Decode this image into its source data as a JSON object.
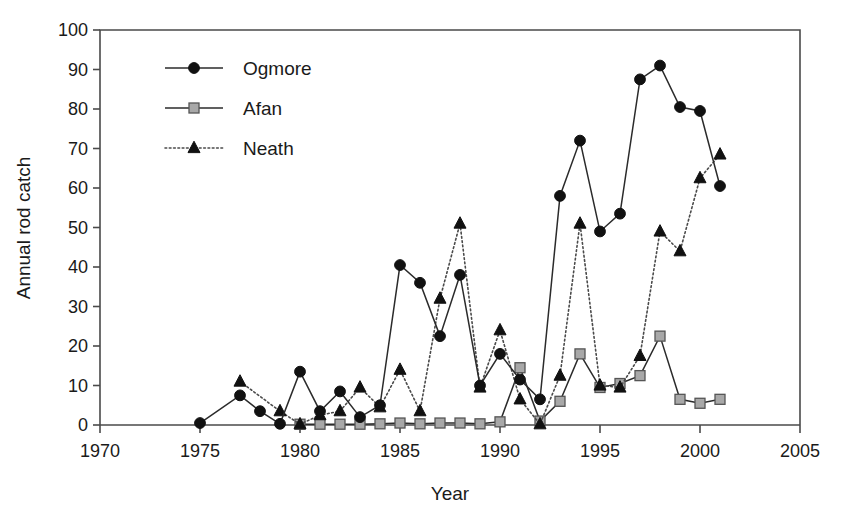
{
  "chart_data": {
    "type": "line",
    "title": "",
    "xlabel": "Year",
    "ylabel": "Annual rod catch",
    "xlim": [
      1970,
      2005
    ],
    "ylim": [
      0,
      100
    ],
    "xticks": [
      1970,
      1975,
      1980,
      1985,
      1990,
      1995,
      2000,
      2005
    ],
    "yticks": [
      0,
      10,
      20,
      30,
      40,
      50,
      60,
      70,
      80,
      90,
      100
    ],
    "grid": false,
    "legend_position": "top-left inside",
    "series": [
      {
        "name": "Ogmore",
        "marker": "filled-circle",
        "line_style": "solid",
        "color": "#111111",
        "x": [
          1975,
          1977,
          1978,
          1979,
          1980,
          1981,
          1982,
          1983,
          1984,
          1985,
          1986,
          1987,
          1988,
          1989,
          1990,
          1991,
          1992,
          1993,
          1994,
          1995,
          1996,
          1997,
          1998,
          1999,
          2000,
          2001
        ],
        "values": [
          0.5,
          7.5,
          3.5,
          0.3,
          13.5,
          3.5,
          8.5,
          2.0,
          5.0,
          40.5,
          36.0,
          22.5,
          38.0,
          10.0,
          18.0,
          11.5,
          6.5,
          58.0,
          72.0,
          49.0,
          53.5,
          87.5,
          91.0,
          80.5,
          79.5,
          60.5
        ]
      },
      {
        "name": "Afan",
        "marker": "gray-square",
        "line_style": "solid",
        "color": "#a8a8a8",
        "x": [
          1980,
          1981,
          1982,
          1983,
          1984,
          1985,
          1986,
          1987,
          1988,
          1989,
          1990,
          1991,
          1992,
          1993,
          1994,
          1995,
          1996,
          1997,
          1998,
          1999,
          2000,
          2001
        ],
        "values": [
          0.2,
          0.2,
          0.2,
          0.2,
          0.3,
          0.5,
          0.3,
          0.5,
          0.5,
          0.3,
          0.8,
          14.5,
          1.0,
          6.0,
          18.0,
          9.5,
          10.5,
          12.5,
          22.5,
          6.5,
          5.5,
          6.5
        ]
      },
      {
        "name": "Neath",
        "marker": "filled-triangle",
        "line_style": "dotted",
        "color": "#111111",
        "x": [
          1977,
          1979,
          1980,
          1981,
          1982,
          1983,
          1984,
          1985,
          1986,
          1987,
          1988,
          1989,
          1990,
          1991,
          1992,
          1993,
          1994,
          1995,
          1996,
          1997,
          1998,
          1999,
          2000,
          2001
        ],
        "values": [
          11.0,
          3.5,
          0.2,
          2.5,
          3.5,
          9.5,
          4.5,
          14.0,
          3.5,
          32.0,
          51.0,
          9.5,
          24.0,
          6.5,
          0.2,
          12.5,
          51.0,
          10.0,
          9.5,
          17.5,
          49.0,
          44.0,
          62.5,
          68.5
        ]
      }
    ]
  },
  "legend": {
    "entries": [
      {
        "label": "Ogmore"
      },
      {
        "label": "Afan"
      },
      {
        "label": "Neath"
      }
    ]
  },
  "axes": {
    "y_title": "Annual rod catch",
    "x_title": "Year",
    "y_tick_labels": [
      "0",
      "10",
      "20",
      "30",
      "40",
      "50",
      "60",
      "70",
      "80",
      "90",
      "100"
    ],
    "x_tick_labels": [
      "1970",
      "1975",
      "1980",
      "1985",
      "1990",
      "1995",
      "2000",
      "2005"
    ]
  }
}
